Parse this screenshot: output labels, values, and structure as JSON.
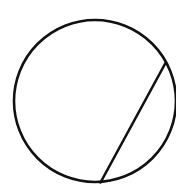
{
  "diagram": {
    "type": "geometry",
    "background": "#ffffff",
    "stroke_color": "#111111",
    "stroke_width": 2.6,
    "circle": {
      "cx": 95,
      "cy": 101,
      "r": 81
    },
    "chord": {
      "x1": 165.5,
      "y1": 63,
      "x2": 100.5,
      "y2": 182.5
    }
  }
}
